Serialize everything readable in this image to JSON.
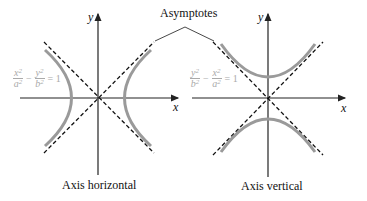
{
  "annotation": {
    "label": "Asymptotes"
  },
  "left": {
    "caption": "Axis horizontal",
    "x_label": "x",
    "y_label": "y",
    "equation": {
      "term1_num": "x",
      "term1_den": "a",
      "term2_num": "y",
      "term2_den": "b",
      "exp": "2",
      "minus": "−",
      "equals": "= 1"
    }
  },
  "right": {
    "caption": "Axis vertical",
    "x_label": "x",
    "y_label": "y",
    "equation": {
      "term1_num": "y",
      "term1_den": "b",
      "term2_num": "x",
      "term2_den": "a",
      "exp": "2",
      "minus": "−",
      "equals": "= 1"
    }
  },
  "colors": {
    "axis": "#222222",
    "asymptote": "#111111",
    "curve": "#9a9a9a",
    "equation": "#aaaaaa"
  }
}
